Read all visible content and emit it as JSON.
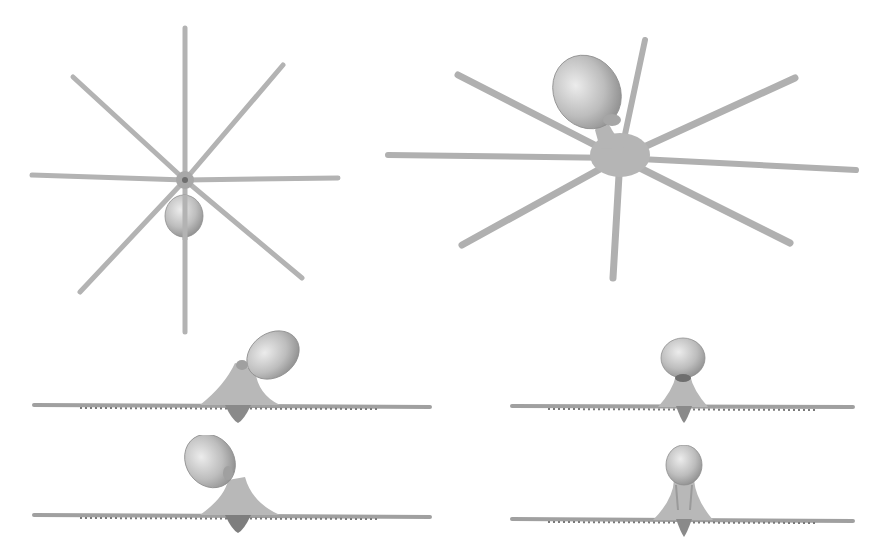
{
  "figure": {
    "background": "#ffffff",
    "mesh_color": "#b8b8b8",
    "mesh_shadow": "#8a8a8a",
    "mesh_highlight": "#e2e2e2",
    "views": [
      {
        "id": "top",
        "label": ""
      },
      {
        "id": "perspective",
        "label": ""
      },
      {
        "id": "side-left",
        "label": ""
      },
      {
        "id": "front",
        "label": ""
      },
      {
        "id": "side-right",
        "label": ""
      },
      {
        "id": "back",
        "label": ""
      }
    ]
  }
}
